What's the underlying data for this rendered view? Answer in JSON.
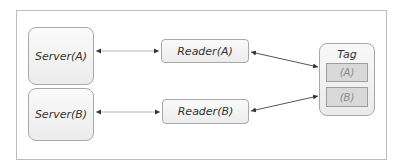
{
  "diagram": {
    "nodes": {
      "server_a": {
        "label": "Server(A)"
      },
      "server_b": {
        "label": "Server(B)"
      },
      "reader_a": {
        "label": "Reader(A)"
      },
      "reader_b": {
        "label": "Reader(B)"
      },
      "tag": {
        "label": "Tag",
        "slots": [
          {
            "label": "(A)"
          },
          {
            "label": "(B)"
          }
        ]
      }
    },
    "edges": [
      {
        "from": "Server(A)",
        "to": "Reader(A)",
        "direction": "bidirectional"
      },
      {
        "from": "Server(B)",
        "to": "Reader(B)",
        "direction": "bidirectional"
      },
      {
        "from": "Reader(A)",
        "to": "Tag",
        "direction": "bidirectional"
      },
      {
        "from": "Reader(B)",
        "to": "Tag",
        "direction": "bidirectional"
      }
    ],
    "colors": {
      "frame_border": "#bdbdbd",
      "node_border": "#a8a8a8",
      "node_fill": "#f2f2f2",
      "slot_fill": "#d9d9d9",
      "server_link": "#b5b5b5",
      "tag_link": "#555555"
    }
  }
}
